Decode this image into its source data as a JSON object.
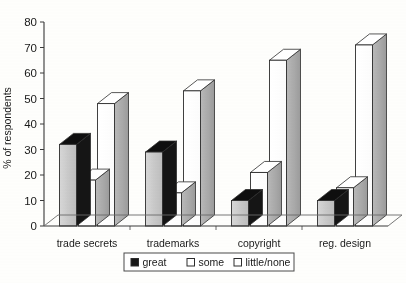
{
  "chart_data": {
    "type": "bar",
    "title": "",
    "subtitle": "",
    "xlabel": "",
    "ylabel": "% of respondents",
    "ylim": [
      0,
      80
    ],
    "yticks": [
      0,
      10,
      20,
      30,
      40,
      50,
      60,
      70,
      80
    ],
    "ytick_labels": [
      "0",
      "10",
      "20",
      "30",
      "40",
      "50",
      "60",
      "70",
      "80"
    ],
    "grid": false,
    "three_d": true,
    "legend_position": "bottom",
    "categories": [
      "trade secrets",
      "trademarks",
      "copyright",
      "reg. design"
    ],
    "series": [
      {
        "name": "great",
        "values": [
          32,
          29,
          10,
          10
        ],
        "color": "#141414",
        "face": "dark"
      },
      {
        "name": "some",
        "values": [
          18,
          13,
          21,
          15
        ],
        "color": "#ffffff",
        "face": "light"
      },
      {
        "name": "little/none",
        "values": [
          48,
          53,
          65,
          71
        ],
        "color": "#ffffff",
        "face": "light"
      }
    ]
  },
  "axis": {
    "y_label": "% of respondents",
    "y_ticks": [
      "80",
      "70",
      "60",
      "50",
      "40",
      "30",
      "20",
      "10",
      "0"
    ]
  },
  "categories": {
    "labels": [
      "trade secrets",
      "trademarks",
      "copyright",
      "reg. design"
    ]
  },
  "legend": {
    "items": [
      {
        "label": "great",
        "swatch": "filled-dark"
      },
      {
        "label": "some",
        "swatch": "outline-light"
      },
      {
        "label": "little/none",
        "swatch": "outline-light"
      }
    ]
  }
}
